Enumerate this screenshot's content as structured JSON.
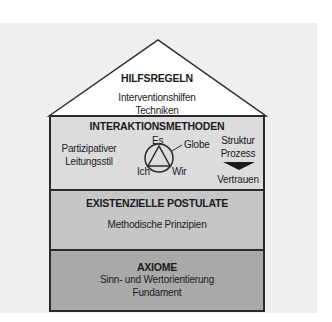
{
  "diagram": {
    "type": "house-model",
    "colors": {
      "background": "#efefef",
      "roof": "#ffffff",
      "layer_interaktion": "#dcdcdc",
      "layer_postulate": "#c6c6c6",
      "layer_axiome": "#a9a9a9",
      "outline": "#2a2a2a"
    },
    "roof": {
      "title": "HILFSREGELN",
      "lines": [
        "Interventionshilfen",
        "Techniken"
      ]
    },
    "interaktion": {
      "title": "INTERAKTIONSMETHODEN",
      "left_lines": [
        "Partizipativer",
        "Leitungsstil"
      ],
      "symbol": {
        "top": "Es",
        "left": "Ich",
        "right": "Wir",
        "pointer": "Globe"
      },
      "right_top_lines": [
        "Struktur",
        "Prozess"
      ],
      "right_bottom": "Vertrauen"
    },
    "postulate": {
      "title": "EXISTENZIELLE POSTULATE",
      "lines": [
        "Methodische Prinzipien"
      ]
    },
    "axiome": {
      "title": "AXIOME",
      "lines": [
        "Sinn- und Wertorientierung",
        "Fundament"
      ]
    }
  }
}
